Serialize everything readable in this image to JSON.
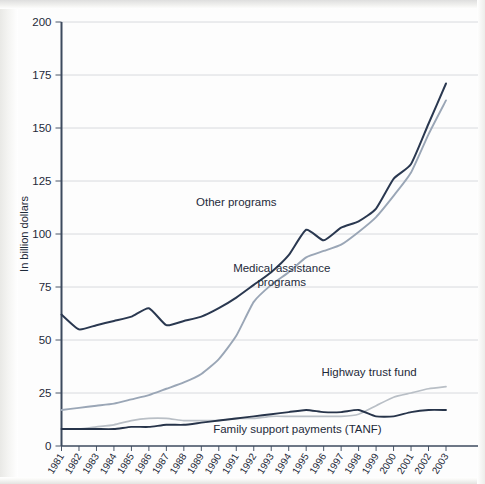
{
  "chart_data": {
    "type": "line",
    "title": "",
    "xlabel": "",
    "ylabel": "In billion dollars",
    "ylim": [
      0,
      200
    ],
    "yticks": [
      0,
      25,
      50,
      75,
      100,
      125,
      150,
      175,
      200
    ],
    "grid": true,
    "legend_position": "inline-annotations",
    "x": [
      1981,
      1982,
      1983,
      1984,
      1985,
      1986,
      1987,
      1988,
      1989,
      1990,
      1991,
      1992,
      1993,
      1994,
      1995,
      1996,
      1997,
      1998,
      1999,
      2000,
      2001,
      2002,
      2003
    ],
    "categories": [
      "1981",
      "1982",
      "1983",
      "1984",
      "1985",
      "1986",
      "1987",
      "1988",
      "1989",
      "1990",
      "1991",
      "1992",
      "1993",
      "1994",
      "1995",
      "1996",
      "1997",
      "1998",
      "1999",
      "2000",
      "2001",
      "2002",
      "2003"
    ],
    "series": [
      {
        "name": "Other programs",
        "color": "#2a3850",
        "width": 2.0,
        "label_x": 1991.0,
        "label_y": 113,
        "values": [
          62,
          55,
          57,
          59,
          61,
          65,
          57,
          59,
          61,
          65,
          70,
          76,
          82,
          90,
          102,
          97,
          103,
          106,
          112,
          126,
          133,
          152,
          171
        ]
      },
      {
        "name": "Medical assistance programs",
        "color": "#9aa6b6",
        "width": 1.9,
        "label_x": 1993.6,
        "label_y": 82,
        "values": [
          17,
          18,
          19,
          20,
          22,
          24,
          27,
          30,
          34,
          41,
          52,
          68,
          76,
          82,
          89,
          92,
          95,
          101,
          108,
          118,
          129,
          147,
          163
        ]
      },
      {
        "name": "Highway trust fund",
        "color": "#b9bfc6",
        "width": 1.7,
        "label_x": 1998.6,
        "label_y": 33,
        "values": [
          8,
          8,
          9,
          10,
          12,
          13,
          13,
          12,
          12,
          12,
          13,
          13,
          14,
          14,
          14,
          14,
          14,
          15,
          19,
          23,
          25,
          27,
          28
        ]
      },
      {
        "name": "Family support payments (TANF)",
        "color": "#27344a",
        "width": 1.9,
        "label_x": 1994.5,
        "label_y": 6.0,
        "values": [
          8,
          8,
          8,
          8,
          9,
          9,
          10,
          10,
          11,
          12,
          13,
          14,
          15,
          16,
          17,
          16,
          16,
          17,
          14,
          14,
          16,
          17,
          17
        ]
      }
    ]
  },
  "axes": {
    "y_title": "In billion dollars"
  }
}
